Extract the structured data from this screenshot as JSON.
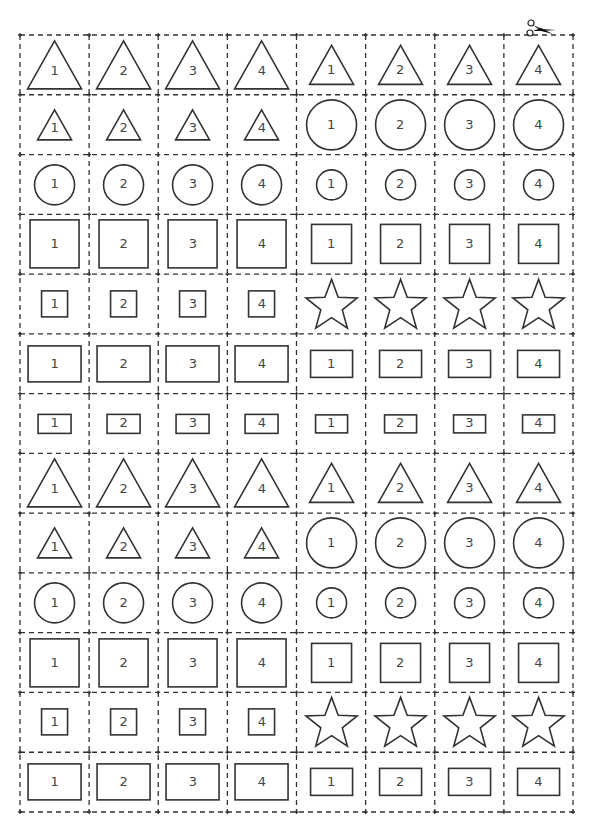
{
  "sheet": {
    "title": "Shape cut-out cards",
    "columns": 8,
    "rows": 13,
    "grid": {
      "left": 20,
      "top": 35,
      "right": 573,
      "bottom": 812
    },
    "line_color": "#333333",
    "shape_stroke": "#333333",
    "label_color": "#444444",
    "scissors_icon": "scissors-icon"
  },
  "rows": [
    {
      "cells": [
        {
          "shape": "triangle",
          "size": "large",
          "label": "1"
        },
        {
          "shape": "triangle",
          "size": "large",
          "label": "2"
        },
        {
          "shape": "triangle",
          "size": "large",
          "label": "3"
        },
        {
          "shape": "triangle",
          "size": "large",
          "label": "4"
        },
        {
          "shape": "triangle",
          "size": "medium",
          "label": "1"
        },
        {
          "shape": "triangle",
          "size": "medium",
          "label": "2"
        },
        {
          "shape": "triangle",
          "size": "medium",
          "label": "3"
        },
        {
          "shape": "triangle",
          "size": "medium",
          "label": "4"
        }
      ]
    },
    {
      "cells": [
        {
          "shape": "triangle",
          "size": "small",
          "label": "1"
        },
        {
          "shape": "triangle",
          "size": "small",
          "label": "2"
        },
        {
          "shape": "triangle",
          "size": "small",
          "label": "3"
        },
        {
          "shape": "triangle",
          "size": "small",
          "label": "4"
        },
        {
          "shape": "circle",
          "size": "large",
          "label": "1"
        },
        {
          "shape": "circle",
          "size": "large",
          "label": "2"
        },
        {
          "shape": "circle",
          "size": "large",
          "label": "3"
        },
        {
          "shape": "circle",
          "size": "large",
          "label": "4"
        }
      ]
    },
    {
      "cells": [
        {
          "shape": "circle",
          "size": "medium",
          "label": "1"
        },
        {
          "shape": "circle",
          "size": "medium",
          "label": "2"
        },
        {
          "shape": "circle",
          "size": "medium",
          "label": "3"
        },
        {
          "shape": "circle",
          "size": "medium",
          "label": "4"
        },
        {
          "shape": "circle",
          "size": "small",
          "label": "1"
        },
        {
          "shape": "circle",
          "size": "small",
          "label": "2"
        },
        {
          "shape": "circle",
          "size": "small",
          "label": "3"
        },
        {
          "shape": "circle",
          "size": "small",
          "label": "4"
        }
      ]
    },
    {
      "cells": [
        {
          "shape": "square",
          "size": "large",
          "label": "1"
        },
        {
          "shape": "square",
          "size": "large",
          "label": "2"
        },
        {
          "shape": "square",
          "size": "large",
          "label": "3"
        },
        {
          "shape": "square",
          "size": "large",
          "label": "4"
        },
        {
          "shape": "square",
          "size": "medium",
          "label": "1"
        },
        {
          "shape": "square",
          "size": "medium",
          "label": "2"
        },
        {
          "shape": "square",
          "size": "medium",
          "label": "3"
        },
        {
          "shape": "square",
          "size": "medium",
          "label": "4"
        }
      ]
    },
    {
      "cells": [
        {
          "shape": "square",
          "size": "small",
          "label": "1"
        },
        {
          "shape": "square",
          "size": "small",
          "label": "2"
        },
        {
          "shape": "square",
          "size": "small",
          "label": "3"
        },
        {
          "shape": "square",
          "size": "small",
          "label": "4"
        },
        {
          "shape": "star",
          "size": "large",
          "label": ""
        },
        {
          "shape": "star",
          "size": "large",
          "label": ""
        },
        {
          "shape": "star",
          "size": "large",
          "label": ""
        },
        {
          "shape": "star",
          "size": "large",
          "label": ""
        }
      ]
    },
    {
      "cells": [
        {
          "shape": "rectangle",
          "size": "large",
          "label": "1"
        },
        {
          "shape": "rectangle",
          "size": "large",
          "label": "2"
        },
        {
          "shape": "rectangle",
          "size": "large",
          "label": "3"
        },
        {
          "shape": "rectangle",
          "size": "large",
          "label": "4"
        },
        {
          "shape": "rectangle",
          "size": "medium",
          "label": "1"
        },
        {
          "shape": "rectangle",
          "size": "medium",
          "label": "2"
        },
        {
          "shape": "rectangle",
          "size": "medium",
          "label": "3"
        },
        {
          "shape": "rectangle",
          "size": "medium",
          "label": "4"
        }
      ]
    },
    {
      "cells": [
        {
          "shape": "rectangle",
          "size": "small",
          "label": "1"
        },
        {
          "shape": "rectangle",
          "size": "small",
          "label": "2"
        },
        {
          "shape": "rectangle",
          "size": "small",
          "label": "3"
        },
        {
          "shape": "rectangle",
          "size": "small",
          "label": "4"
        },
        {
          "shape": "rectangle",
          "size": "tiny",
          "label": "1"
        },
        {
          "shape": "rectangle",
          "size": "tiny",
          "label": "2"
        },
        {
          "shape": "rectangle",
          "size": "tiny",
          "label": "3"
        },
        {
          "shape": "rectangle",
          "size": "tiny",
          "label": "4"
        }
      ]
    },
    {
      "cells": [
        {
          "shape": "triangle",
          "size": "large",
          "label": "1"
        },
        {
          "shape": "triangle",
          "size": "large",
          "label": "2"
        },
        {
          "shape": "triangle",
          "size": "large",
          "label": "3"
        },
        {
          "shape": "triangle",
          "size": "large",
          "label": "4"
        },
        {
          "shape": "triangle",
          "size": "medium",
          "label": "1"
        },
        {
          "shape": "triangle",
          "size": "medium",
          "label": "2"
        },
        {
          "shape": "triangle",
          "size": "medium",
          "label": "3"
        },
        {
          "shape": "triangle",
          "size": "medium",
          "label": "4"
        }
      ]
    },
    {
      "cells": [
        {
          "shape": "triangle",
          "size": "small",
          "label": "1"
        },
        {
          "shape": "triangle",
          "size": "small",
          "label": "2"
        },
        {
          "shape": "triangle",
          "size": "small",
          "label": "3"
        },
        {
          "shape": "triangle",
          "size": "small",
          "label": "4"
        },
        {
          "shape": "circle",
          "size": "large",
          "label": "1"
        },
        {
          "shape": "circle",
          "size": "large",
          "label": "2"
        },
        {
          "shape": "circle",
          "size": "large",
          "label": "3"
        },
        {
          "shape": "circle",
          "size": "large",
          "label": "4"
        }
      ]
    },
    {
      "cells": [
        {
          "shape": "circle",
          "size": "medium",
          "label": "1"
        },
        {
          "shape": "circle",
          "size": "medium",
          "label": "2"
        },
        {
          "shape": "circle",
          "size": "medium",
          "label": "3"
        },
        {
          "shape": "circle",
          "size": "medium",
          "label": "4"
        },
        {
          "shape": "circle",
          "size": "small",
          "label": "1"
        },
        {
          "shape": "circle",
          "size": "small",
          "label": "2"
        },
        {
          "shape": "circle",
          "size": "small",
          "label": "3"
        },
        {
          "shape": "circle",
          "size": "small",
          "label": "4"
        }
      ]
    },
    {
      "cells": [
        {
          "shape": "square",
          "size": "large",
          "label": "1"
        },
        {
          "shape": "square",
          "size": "large",
          "label": "2"
        },
        {
          "shape": "square",
          "size": "large",
          "label": "3"
        },
        {
          "shape": "square",
          "size": "large",
          "label": "4"
        },
        {
          "shape": "square",
          "size": "medium",
          "label": "1"
        },
        {
          "shape": "square",
          "size": "medium",
          "label": "2"
        },
        {
          "shape": "square",
          "size": "medium",
          "label": "3"
        },
        {
          "shape": "square",
          "size": "medium",
          "label": "4"
        }
      ]
    },
    {
      "cells": [
        {
          "shape": "square",
          "size": "small",
          "label": "1"
        },
        {
          "shape": "square",
          "size": "small",
          "label": "2"
        },
        {
          "shape": "square",
          "size": "small",
          "label": "3"
        },
        {
          "shape": "square",
          "size": "small",
          "label": "4"
        },
        {
          "shape": "star",
          "size": "large",
          "label": ""
        },
        {
          "shape": "star",
          "size": "large",
          "label": ""
        },
        {
          "shape": "star",
          "size": "large",
          "label": ""
        },
        {
          "shape": "star",
          "size": "large",
          "label": ""
        }
      ]
    },
    {
      "cells": [
        {
          "shape": "rectangle",
          "size": "large",
          "label": "1"
        },
        {
          "shape": "rectangle",
          "size": "large",
          "label": "2"
        },
        {
          "shape": "rectangle",
          "size": "large",
          "label": "3"
        },
        {
          "shape": "rectangle",
          "size": "large",
          "label": "4"
        },
        {
          "shape": "rectangle",
          "size": "medium",
          "label": "1"
        },
        {
          "shape": "rectangle",
          "size": "medium",
          "label": "2"
        },
        {
          "shape": "rectangle",
          "size": "medium",
          "label": "3"
        },
        {
          "shape": "rectangle",
          "size": "medium",
          "label": "4"
        }
      ]
    }
  ]
}
